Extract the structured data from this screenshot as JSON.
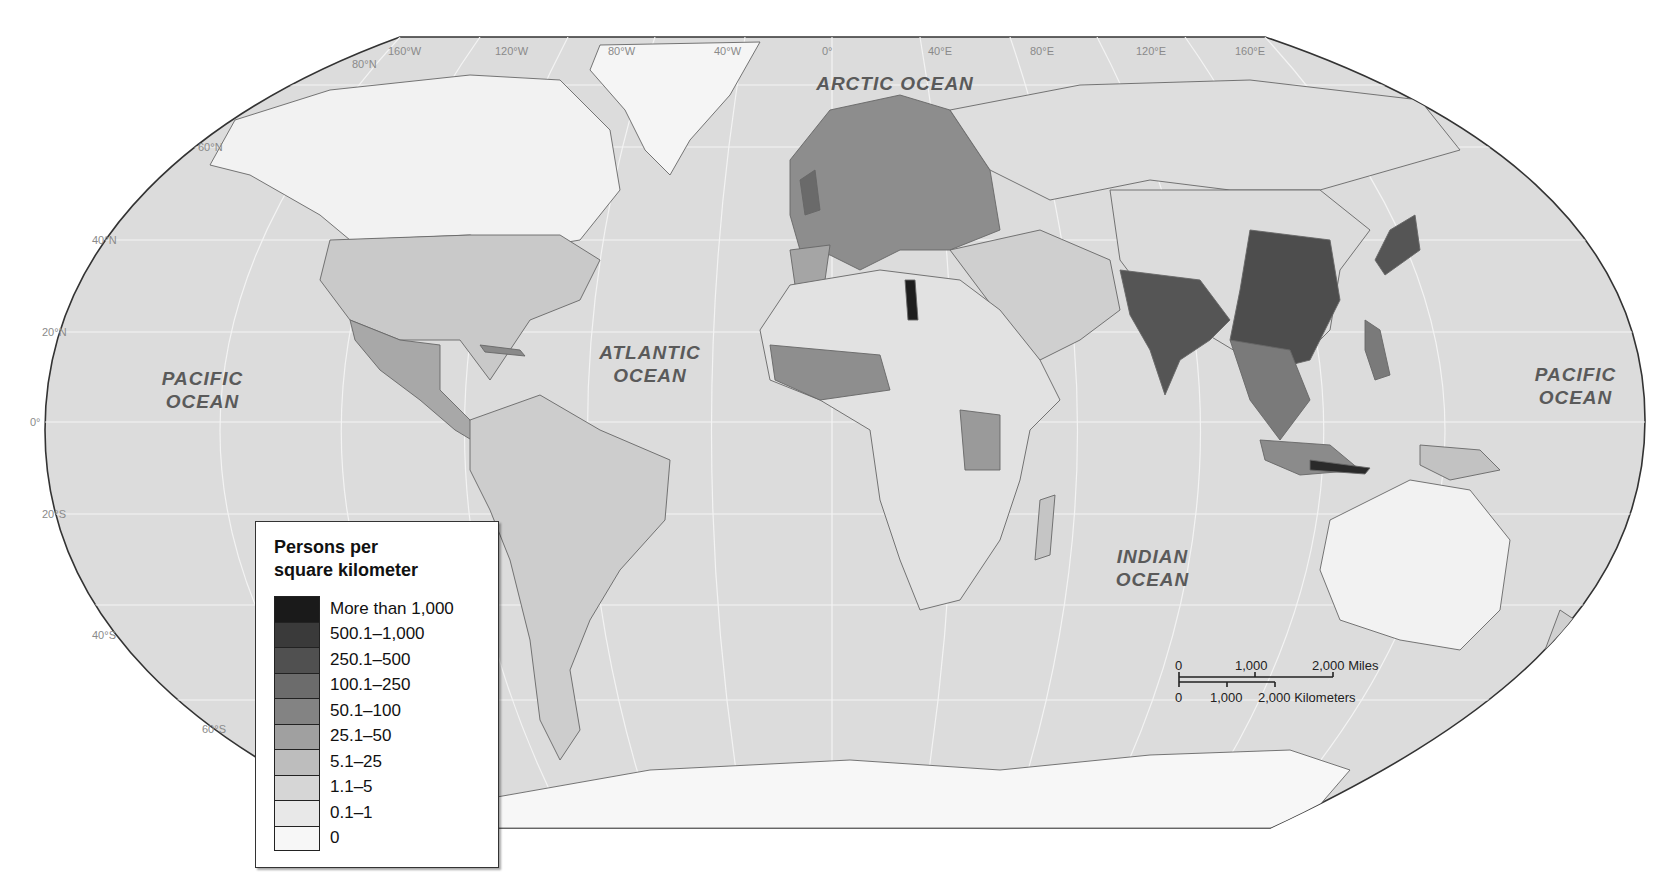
{
  "map": {
    "type": "choropleth",
    "projection": "Robinson",
    "subject": "World population density",
    "colors": {
      "ocean": "#dcdcdc",
      "land_base": "#eeeeee",
      "border": "#777777",
      "frame": "#333333",
      "graticule": "#f4f4f4"
    }
  },
  "graticule": {
    "longitudes": [
      "160°W",
      "120°W",
      "80°W",
      "40°W",
      "0°",
      "40°E",
      "80°E",
      "120°E",
      "160°E"
    ],
    "latitudes": [
      "80°N",
      "60°N",
      "40°N",
      "20°N",
      "0°",
      "20°S",
      "40°S",
      "60°S"
    ]
  },
  "oceans": {
    "arctic": "ARCTIC OCEAN",
    "atlantic_line1": "ATLANTIC",
    "atlantic_line2": "OCEAN",
    "pacific_west_line1": "PACIFIC",
    "pacific_west_line2": "OCEAN",
    "pacific_east_line1": "PACIFIC",
    "pacific_east_line2": "OCEAN",
    "indian_line1": "INDIAN",
    "indian_line2": "OCEAN"
  },
  "legend": {
    "title_line1": "Persons per",
    "title_line2": "square kilometer",
    "items": [
      {
        "label": "More than 1,000",
        "color": "#1a1a1a"
      },
      {
        "label": "500.1–1,000",
        "color": "#3a3a3a"
      },
      {
        "label": "250.1–500",
        "color": "#505050"
      },
      {
        "label": "100.1–250",
        "color": "#6c6c6c"
      },
      {
        "label": "50.1–100",
        "color": "#838383"
      },
      {
        "label": "25.1–50",
        "color": "#a0a0a0"
      },
      {
        "label": "5.1–25",
        "color": "#bdbdbd"
      },
      {
        "label": "1.1–5",
        "color": "#d6d6d6"
      },
      {
        "label": "0.1–1",
        "color": "#e8e8e8"
      },
      {
        "label": "0",
        "color": "#f7f7f7"
      }
    ]
  },
  "scale_bar": {
    "miles_labels": [
      "0",
      "1,000",
      "2,000 Miles"
    ],
    "km_labels": [
      "0",
      "1,000",
      "2,000 Kilometers"
    ]
  }
}
